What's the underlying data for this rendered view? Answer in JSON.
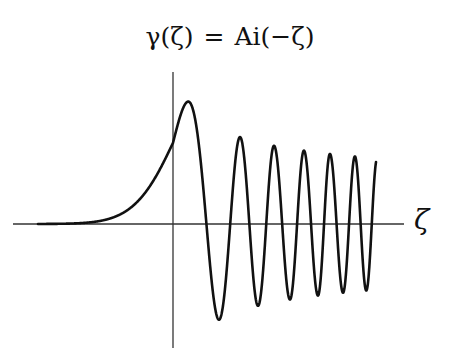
{
  "chart_data": {
    "type": "line",
    "title_parts": {
      "lhs": "γ(ζ)",
      "eq": "=",
      "rhs": "Ai(−ζ)"
    },
    "xlabel": "ζ",
    "ylabel": "",
    "grid": false,
    "legend": null,
    "axes_style": "cross-through-origin, no ticks",
    "x_range_approx": [
      -4.5,
      18
    ],
    "series": [
      {
        "name": "Ai(−ζ)",
        "description": "Airy function of negative argument: exponentially decaying for ζ<0, oscillating with slowly decreasing amplitude and increasing frequency for ζ>0",
        "features": {
          "first_peak": {
            "x": 1.0,
            "y": 0.536
          },
          "peaks": [
            {
              "x": 1.0,
              "y": 0.536
            },
            {
              "x": 4.82,
              "y": 0.38
            },
            {
              "x": 7.37,
              "y": 0.339
            },
            {
              "x": 9.54,
              "y": 0.316
            },
            {
              "x": 11.48,
              "y": 0.3
            },
            {
              "x": 13.27,
              "y": 0.288
            }
          ],
          "troughs": [
            {
              "x": 3.25,
              "y": -0.419
            },
            {
              "x": 6.16,
              "y": -0.357
            },
            {
              "x": 8.49,
              "y": -0.327
            },
            {
              "x": 10.53,
              "y": -0.307
            },
            {
              "x": 12.38,
              "y": -0.294
            },
            {
              "x": 14.09,
              "y": -0.283
            }
          ],
          "value_at_zero": 0.355
        }
      }
    ]
  },
  "colors": {
    "curve": "#111111",
    "axis": "#333333",
    "background": "#ffffff"
  }
}
